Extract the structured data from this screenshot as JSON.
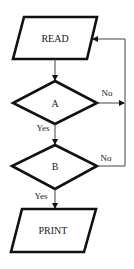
{
  "diagram": {
    "type": "flowchart",
    "nodes": [
      {
        "id": "read",
        "shape": "parallelogram",
        "label": "READ"
      },
      {
        "id": "a",
        "shape": "diamond",
        "label": "A"
      },
      {
        "id": "b",
        "shape": "diamond",
        "label": "B"
      },
      {
        "id": "print",
        "shape": "parallelogram",
        "label": "PRINT"
      }
    ],
    "edges": [
      {
        "from": "read",
        "to": "a",
        "label": ""
      },
      {
        "from": "a",
        "to": "b",
        "label": "Yes"
      },
      {
        "from": "a",
        "to": "read",
        "label": "No"
      },
      {
        "from": "b",
        "to": "print",
        "label": "Yes"
      },
      {
        "from": "b",
        "to": "read",
        "label": "No"
      }
    ],
    "labels": {
      "read": "READ",
      "a": "A",
      "b": "B",
      "print": "PRINT",
      "a_yes": "Yes",
      "a_no": "No",
      "b_yes": "Yes",
      "b_no": "No"
    },
    "colors": {
      "stroke": "#111111",
      "thin": "#444444",
      "background": "#ffffff"
    }
  }
}
